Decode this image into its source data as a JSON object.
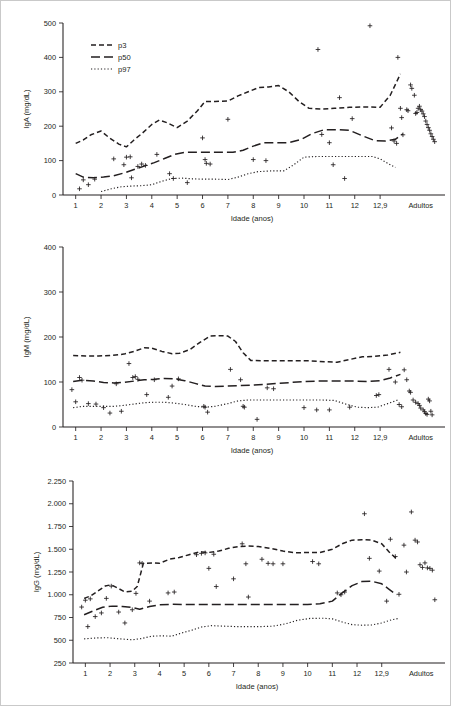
{
  "figure": {
    "border_color": "#c9c9c9",
    "ink_color": "#231f20",
    "legend": {
      "items": [
        {
          "label": "p3",
          "style": "dashed"
        },
        {
          "label": "p50",
          "style": "long-dash"
        },
        {
          "label": "p97",
          "style": "dotted"
        }
      ]
    }
  },
  "chart_data": [
    {
      "type": "line",
      "id": "iga",
      "title": "",
      "xlabel": "Idade (anos)",
      "ylabel": "IgA (mg/dL)",
      "ylim": [
        0,
        500
      ],
      "yticks": [
        0,
        100,
        200,
        300,
        400,
        500
      ],
      "ytick_labels": [
        "0",
        "100",
        "200",
        "300",
        "400",
        "500"
      ],
      "xlim": [
        0.5,
        15.4
      ],
      "xticks": [
        1,
        2,
        3,
        4,
        5,
        6,
        7,
        8,
        9,
        10,
        11,
        12,
        13,
        14.6
      ],
      "xtick_labels": [
        "1",
        "2",
        "3",
        "4",
        "5",
        "6",
        "7",
        "8",
        "9",
        "10",
        "11",
        "12",
        "12,9",
        "Adultos"
      ],
      "grid": false,
      "legend_position": "top-left",
      "series": [
        {
          "name": "p3",
          "x": [
            1.0,
            1.3,
            1.6,
            2.0,
            2.35,
            2.7,
            3.0,
            3.3,
            3.6,
            4.0,
            4.3,
            4.6,
            5.0,
            5.4,
            5.8,
            6.1,
            6.5,
            7.0,
            7.4,
            7.8,
            8.2,
            8.6,
            9.0,
            9.4,
            9.8,
            10.2,
            10.7,
            11.2,
            11.8,
            12.4,
            13.0,
            13.4,
            13.8
          ],
          "values": [
            150,
            160,
            175,
            186,
            165,
            148,
            140,
            160,
            178,
            205,
            218,
            210,
            196,
            215,
            245,
            272,
            272,
            273,
            288,
            300,
            312,
            314,
            318,
            300,
            272,
            252,
            250,
            252,
            255,
            256,
            255,
            290,
            352
          ]
        },
        {
          "name": "p50",
          "x": [
            1.0,
            1.3,
            1.7,
            2.1,
            2.5,
            2.9,
            3.3,
            3.7,
            4.1,
            4.5,
            4.9,
            5.3,
            5.8,
            6.3,
            6.8,
            7.2,
            7.6,
            8.0,
            8.4,
            8.9,
            9.4,
            9.9,
            10.3,
            10.8,
            11.3,
            11.8,
            12.3,
            12.8,
            13.2,
            13.6,
            13.9
          ],
          "values": [
            62,
            52,
            50,
            52,
            56,
            64,
            74,
            84,
            94,
            106,
            118,
            124,
            124,
            124,
            124,
            124,
            130,
            142,
            152,
            152,
            152,
            162,
            178,
            190,
            190,
            188,
            172,
            158,
            157,
            162,
            178
          ]
        },
        {
          "name": "p97",
          "x": [
            2.0,
            2.4,
            2.8,
            3.2,
            3.6,
            4.0,
            4.4,
            4.8,
            5.2,
            5.6,
            6.0,
            6.5,
            7.0,
            7.4,
            7.8,
            8.2,
            8.7,
            9.2,
            9.6,
            10.0,
            10.5,
            11.0,
            11.6,
            12.2,
            12.7,
            13.0,
            13.3,
            13.6
          ],
          "values": [
            10,
            18,
            24,
            26,
            27,
            30,
            40,
            48,
            49,
            47,
            46,
            46,
            45,
            52,
            62,
            68,
            70,
            70,
            88,
            110,
            112,
            112,
            112,
            112,
            112,
            105,
            92,
            80
          ]
        }
      ],
      "scatter": {
        "x": [
          1.15,
          1.3,
          1.5,
          1.75,
          2.5,
          2.9,
          3.0,
          3.15,
          3.2,
          3.45,
          3.6,
          3.75,
          4.2,
          4.7,
          4.85,
          5.4,
          6.0,
          6.1,
          6.15,
          6.3,
          7.0,
          8.0,
          8.5,
          10.55,
          10.7,
          11.0,
          11.15,
          11.4,
          11.6,
          11.9,
          12.6,
          13.45,
          13.55,
          13.65,
          13.7,
          13.8,
          13.85,
          13.9,
          14.05,
          14.1,
          14.2,
          14.25,
          14.35,
          14.4,
          14.45,
          14.5,
          14.55,
          14.6,
          14.65,
          14.7,
          14.75,
          14.8,
          14.85,
          14.9,
          14.95,
          15.0,
          15.05,
          15.1,
          15.15
        ],
        "values": [
          18,
          44,
          30,
          46,
          105,
          88,
          110,
          111,
          50,
          83,
          90,
          86,
          118,
          62,
          48,
          36,
          166,
          103,
          92,
          90,
          220,
          103,
          100,
          423,
          176,
          152,
          88,
          283,
          48,
          222,
          492,
          195,
          157,
          150,
          400,
          252,
          225,
          175,
          248,
          245,
          320,
          310,
          290,
          237,
          240,
          252,
          258,
          248,
          244,
          236,
          228,
          215,
          205,
          196,
          188,
          178,
          170,
          162,
          155
        ]
      }
    },
    {
      "type": "line",
      "id": "igm",
      "title": "",
      "xlabel": "Idade (anos)",
      "ylabel": "IgM (mg/dL)",
      "ylim": [
        0,
        400
      ],
      "yticks": [
        0,
        100,
        200,
        300,
        400
      ],
      "ytick_labels": [
        "0",
        "100",
        "200",
        "300",
        "400"
      ],
      "xlim": [
        0.5,
        15.4
      ],
      "xticks": [
        1,
        2,
        3,
        4,
        5,
        6,
        7,
        8,
        9,
        10,
        11,
        12,
        13,
        14.6
      ],
      "xtick_labels": [
        "1",
        "2",
        "3",
        "4",
        "5",
        "6",
        "7",
        "8",
        "9",
        "10",
        "11",
        "12",
        "12,9",
        "Adultos"
      ],
      "grid": false,
      "legend_position": "none",
      "series": [
        {
          "name": "p3",
          "x": [
            0.9,
            1.4,
            1.9,
            2.4,
            2.9,
            3.3,
            3.7,
            4.0,
            4.4,
            4.8,
            5.1,
            5.5,
            5.9,
            6.3,
            6.7,
            7.0,
            7.3,
            7.6,
            7.9,
            8.4,
            9.0,
            9.6,
            10.2,
            10.8,
            11.3,
            11.8,
            12.3,
            12.8,
            13.3,
            13.8
          ],
          "values": [
            159,
            158,
            158,
            159,
            162,
            168,
            176,
            175,
            168,
            163,
            164,
            172,
            188,
            202,
            203,
            202,
            190,
            165,
            148,
            147,
            147,
            147,
            147,
            145,
            144,
            150,
            156,
            157,
            160,
            166
          ]
        },
        {
          "name": "p50",
          "x": [
            0.9,
            1.3,
            1.7,
            2.1,
            2.5,
            2.9,
            3.3,
            3.7,
            4.1,
            4.5,
            4.9,
            5.3,
            5.7,
            6.1,
            6.5,
            7.0,
            7.5,
            8.0,
            8.5,
            9.0,
            9.5,
            10.0,
            10.5,
            11.0,
            11.5,
            12.0,
            12.5,
            13.0,
            13.4,
            13.8
          ],
          "values": [
            101,
            104,
            102,
            99,
            98,
            99,
            102,
            105,
            106,
            108,
            107,
            103,
            97,
            91,
            90,
            91,
            92,
            93,
            95,
            97,
            99,
            101,
            102,
            102,
            102,
            102,
            101,
            103,
            109,
            117
          ]
        },
        {
          "name": "p97",
          "x": [
            0.9,
            1.3,
            1.7,
            2.1,
            2.5,
            2.9,
            3.3,
            3.7,
            4.1,
            4.5,
            4.9,
            5.3,
            5.7,
            6.1,
            6.5,
            7.0,
            7.4,
            7.8,
            8.2,
            8.7,
            9.2,
            9.7,
            10.2,
            10.7,
            11.2,
            11.7,
            12.1,
            12.5,
            12.9,
            13.3,
            13.7
          ],
          "values": [
            43,
            46,
            46,
            46,
            46,
            48,
            51,
            54,
            55,
            55,
            53,
            50,
            46,
            44,
            46,
            52,
            58,
            60,
            60,
            60,
            60,
            60,
            60,
            60,
            59,
            50,
            44,
            43,
            44,
            52,
            60
          ]
        }
      ],
      "scatter": {
        "x": [
          0.85,
          1.0,
          1.15,
          1.25,
          1.5,
          1.8,
          2.1,
          2.35,
          2.6,
          2.8,
          3.1,
          3.25,
          3.35,
          3.45,
          3.8,
          4.1,
          4.65,
          4.8,
          5.05,
          6.05,
          6.1,
          6.2,
          7.1,
          7.5,
          7.6,
          7.65,
          8.15,
          8.55,
          8.8,
          10.0,
          10.5,
          11.0,
          11.8,
          12.85,
          12.95,
          13.35,
          13.6,
          13.75,
          13.85,
          13.95,
          14.05,
          14.15,
          14.2,
          14.3,
          14.4,
          14.5,
          14.55,
          14.6,
          14.7,
          14.75,
          14.8,
          14.85,
          14.9,
          14.95,
          15.0,
          15.05
        ],
        "values": [
          83,
          56,
          110,
          104,
          52,
          51,
          43,
          31,
          96,
          35,
          141,
          110,
          112,
          106,
          72,
          105,
          66,
          91,
          107,
          46,
          44,
          33,
          128,
          105,
          46,
          44,
          17,
          87,
          85,
          43,
          38,
          38,
          44,
          70,
          72,
          128,
          100,
          50,
          45,
          127,
          105,
          80,
          77,
          60,
          55,
          52,
          48,
          42,
          38,
          34,
          30,
          28,
          62,
          58,
          35,
          27
        ]
      }
    },
    {
      "type": "line",
      "id": "igg",
      "title": "",
      "xlabel": "Idade (anos)",
      "ylabel": "IgG (mg/dL)",
      "ylim": [
        250,
        2250
      ],
      "yticks": [
        250,
        500,
        750,
        1000,
        1250,
        1500,
        1750,
        2000,
        2250
      ],
      "ytick_labels": [
        "250",
        "500",
        "750",
        "1.000",
        "1.250",
        "1.500",
        "1.750",
        "2.000",
        "2.250"
      ],
      "xlim": [
        0.5,
        15.4
      ],
      "xticks": [
        1,
        2,
        3,
        4,
        5,
        6,
        7,
        8,
        9,
        10,
        11,
        12,
        13,
        14.6
      ],
      "xtick_labels": [
        "1",
        "2",
        "3",
        "4",
        "5",
        "6",
        "7",
        "8",
        "9",
        "10",
        "11",
        "12",
        "12,9",
        "Adultos"
      ],
      "grid": false,
      "legend_position": "none",
      "series": [
        {
          "name": "p3",
          "x": [
            0.95,
            1.2,
            1.5,
            1.8,
            2.05,
            2.3,
            2.6,
            2.9,
            3.1,
            3.35,
            3.7,
            4.0,
            4.4,
            4.8,
            5.2,
            5.6,
            6.0,
            6.4,
            6.8,
            7.2,
            7.6,
            8.0,
            8.5,
            9.0,
            9.5,
            10.0,
            10.5,
            11.0,
            11.4,
            11.8,
            12.2,
            12.6,
            13.0,
            13.3,
            13.6
          ],
          "values": [
            960,
            985,
            1040,
            1095,
            1110,
            1075,
            1030,
            1040,
            1090,
            1345,
            1350,
            1345,
            1390,
            1410,
            1440,
            1470,
            1465,
            1480,
            1510,
            1530,
            1535,
            1530,
            1510,
            1480,
            1460,
            1465,
            1465,
            1500,
            1560,
            1600,
            1605,
            1600,
            1560,
            1470,
            1395
          ]
        },
        {
          "name": "p50",
          "x": [
            0.95,
            1.3,
            1.7,
            2.1,
            2.5,
            2.9,
            3.2,
            3.6,
            4.0,
            4.5,
            5.0,
            5.5,
            6.0,
            6.5,
            7.0,
            7.5,
            8.0,
            8.5,
            9.0,
            9.5,
            10.0,
            10.5,
            11.0,
            11.4,
            11.8,
            12.2,
            12.6,
            13.0,
            13.3,
            13.6
          ],
          "values": [
            780,
            820,
            862,
            875,
            872,
            860,
            840,
            870,
            890,
            895,
            893,
            893,
            893,
            893,
            893,
            893,
            893,
            893,
            893,
            893,
            893,
            900,
            930,
            1020,
            1100,
            1145,
            1148,
            1120,
            1060,
            1000
          ]
        },
        {
          "name": "p97",
          "x": [
            0.95,
            1.4,
            1.9,
            2.4,
            2.9,
            3.3,
            3.7,
            4.1,
            4.5,
            4.9,
            5.3,
            5.7,
            6.1,
            6.6,
            7.1,
            7.6,
            8.1,
            8.6,
            9.1,
            9.6,
            10.1,
            10.6,
            11.0,
            11.4,
            11.8,
            12.2,
            12.6,
            13.0,
            13.4,
            13.7
          ],
          "values": [
            515,
            525,
            528,
            515,
            505,
            520,
            545,
            548,
            545,
            580,
            610,
            645,
            660,
            655,
            650,
            650,
            650,
            655,
            680,
            720,
            740,
            742,
            735,
            700,
            672,
            665,
            668,
            690,
            725,
            740
          ]
        }
      ],
      "scatter": {
        "x": [
          0.85,
          1.0,
          1.1,
          1.2,
          1.4,
          1.65,
          1.85,
          2.05,
          2.35,
          2.6,
          2.9,
          3.05,
          3.2,
          3.3,
          3.6,
          4.35,
          4.6,
          5.5,
          5.7,
          5.85,
          6.0,
          6.2,
          6.3,
          7.0,
          7.35,
          7.5,
          7.6,
          8.15,
          8.4,
          8.6,
          9.0,
          10.2,
          10.45,
          11.2,
          11.35,
          11.5,
          12.3,
          12.5,
          12.9,
          13.2,
          13.35,
          13.55,
          13.7,
          13.9,
          14.0,
          14.2,
          14.35,
          14.45,
          14.55,
          14.65,
          14.75,
          14.85,
          14.95,
          15.05,
          15.15
        ],
        "values": [
          865,
          940,
          650,
          955,
          760,
          800,
          960,
          1095,
          810,
          690,
          835,
          1015,
          1350,
          1345,
          930,
          1020,
          1030,
          1440,
          1455,
          1460,
          1290,
          1445,
          1090,
          1175,
          1560,
          1340,
          975,
          1390,
          1345,
          1340,
          1340,
          1365,
          1340,
          1020,
          1000,
          1030,
          1890,
          1400,
          1260,
          930,
          1610,
          1420,
          1005,
          1545,
          1250,
          1910,
          1600,
          1580,
          1330,
          1300,
          1350,
          1295,
          1290,
          1270,
          945
        ]
      }
    }
  ]
}
